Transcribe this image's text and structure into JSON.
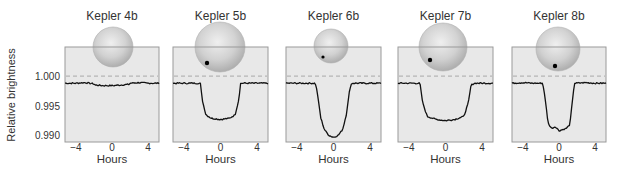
{
  "chart_data": {
    "type": "line",
    "title": "",
    "ylabel": "Relative brightness",
    "xlabel": "Hours",
    "ylim": [
      0.9889,
      1.0049
    ],
    "xlim": [
      -5.2,
      5.2
    ],
    "yticks": [
      1.0,
      0.995,
      0.99
    ],
    "ytick_labels": [
      "1.000",
      "0.995",
      "0.990"
    ],
    "xticks": [
      -4,
      0,
      4
    ],
    "xtick_labels": [
      "−4",
      "0",
      "4"
    ],
    "reference_line": {
      "y": 1.0,
      "style": "dashed"
    },
    "grid": false,
    "legend": null,
    "series": [
      {
        "name": "Kepler 4b",
        "baseline": 0.9988,
        "depth_min": 0.9984,
        "ingress": -1.9,
        "egress": 1.9,
        "x": [
          -5.2,
          -4,
          -3,
          -2,
          -1.9,
          -1,
          0,
          1,
          1.9,
          2,
          3,
          4,
          5.2
        ],
        "y": [
          0.9988,
          0.9988,
          0.9989,
          0.9987,
          0.9985,
          0.9984,
          0.9984,
          0.9985,
          0.9986,
          0.9988,
          0.9989,
          0.9988,
          0.9988
        ],
        "star": {
          "cx": 113,
          "cy": 47,
          "r": 20
        },
        "planet": null
      },
      {
        "name": "Kepler 5b",
        "baseline": 0.9988,
        "depth_min": 0.9927,
        "ingress": -2.0,
        "egress": 2.0,
        "x": [
          -5.2,
          -4,
          -3,
          -2.2,
          -2.0,
          -1.6,
          -1,
          0,
          1,
          1.6,
          2.0,
          2.2,
          3,
          4,
          5.2
        ],
        "y": [
          0.9988,
          0.9988,
          0.9988,
          0.9988,
          0.996,
          0.9935,
          0.9929,
          0.9927,
          0.9929,
          0.9935,
          0.996,
          0.9988,
          0.9988,
          0.9988,
          0.9988
        ],
        "star": {
          "cx": 220,
          "cy": 47,
          "r": 25
        },
        "planet": {
          "cx": 207,
          "cy": 63,
          "r": 2.2
        }
      },
      {
        "name": "Kepler 6b",
        "baseline": 0.9988,
        "depth_min": 0.9897,
        "ingress": -1.8,
        "egress": 1.8,
        "x": [
          -5.2,
          -4,
          -3,
          -2.0,
          -1.8,
          -1.4,
          -1,
          -0.5,
          0,
          0.5,
          1,
          1.4,
          1.8,
          2.0,
          3,
          4,
          5.2
        ],
        "y": [
          0.9988,
          0.9988,
          0.9988,
          0.9988,
          0.9975,
          0.993,
          0.991,
          0.99,
          0.9897,
          0.99,
          0.991,
          0.9935,
          0.998,
          0.9988,
          0.9988,
          0.9988,
          0.9988
        ],
        "star": {
          "cx": 331,
          "cy": 46,
          "r": 17
        },
        "planet": {
          "cx": 323,
          "cy": 57,
          "r": 1.6
        }
      },
      {
        "name": "Kepler 7b",
        "baseline": 0.9988,
        "depth_min": 0.9925,
        "ingress": -2.6,
        "egress": 2.6,
        "x": [
          -5.2,
          -4,
          -3.2,
          -2.8,
          -2.5,
          -2,
          -1,
          0,
          1,
          2,
          2.5,
          2.8,
          3.2,
          4,
          5.2
        ],
        "y": [
          0.9988,
          0.9988,
          0.9988,
          0.9988,
          0.9955,
          0.9932,
          0.9927,
          0.9925,
          0.9927,
          0.9932,
          0.9955,
          0.9985,
          0.9988,
          0.9988,
          0.9988
        ],
        "star": {
          "cx": 443,
          "cy": 47,
          "r": 24
        },
        "planet": {
          "cx": 430,
          "cy": 60,
          "r": 2.2
        }
      },
      {
        "name": "Kepler 8b",
        "baseline": 0.9988,
        "depth_min": 0.9908,
        "ingress": -1.6,
        "egress": 1.6,
        "x": [
          -5.2,
          -4,
          -3,
          -1.8,
          -1.6,
          -1.2,
          -0.8,
          -0.4,
          0,
          0.4,
          0.8,
          1.2,
          1.5,
          1.7,
          3,
          4,
          5.2
        ],
        "y": [
          0.9988,
          0.9989,
          0.9988,
          0.9988,
          0.997,
          0.992,
          0.9912,
          0.9915,
          0.9908,
          0.991,
          0.9912,
          0.9918,
          0.996,
          0.9988,
          0.9989,
          0.9988,
          0.9988
        ],
        "star": {
          "cx": 558,
          "cy": 49,
          "r": 22
        },
        "planet": {
          "cx": 555,
          "cy": 66,
          "r": 2.2
        }
      }
    ],
    "layout": {
      "panels_x": [
        [
          65,
          159
        ],
        [
          173,
          268
        ],
        [
          286,
          381
        ],
        [
          398,
          493
        ],
        [
          512,
          606
        ]
      ],
      "panel_top": 47,
      "panel_bottom": 142,
      "title_y": 20,
      "xtick_y": 151,
      "xlabel_y": 163
    },
    "colors": {
      "panel_bg": "#e8e8e8",
      "panel_border": "#9a9a9a",
      "curve": "#111111",
      "dashed": "#a8a8a8",
      "star_fill": "#c8c8c8",
      "planet": "#000000"
    }
  }
}
